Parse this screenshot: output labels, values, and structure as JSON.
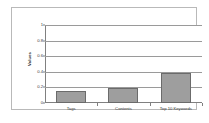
{
  "chart_data": {
    "type": "bar",
    "title": "",
    "subtitle": "",
    "xlabel": "",
    "ylabel": "Values",
    "categories": [
      "Tags",
      "Contents",
      "Top 10 Keywords"
    ],
    "values": [
      0.15,
      0.19,
      0.38
    ],
    "series": [
      {
        "name": "Series 1",
        "values": [
          0.15,
          0.19,
          0.38
        ]
      }
    ],
    "ylim": [
      0,
      1
    ],
    "ytick_labels": [
      "0",
      "0.2",
      "0.4",
      "0.6",
      "0.8",
      "1"
    ],
    "ytick_values": [
      0,
      0.2,
      0.4,
      0.6,
      0.8,
      1
    ],
    "grid": true,
    "grid_axis": "y",
    "legend": false,
    "legend_position": "none",
    "bar_fill_color": "#9e9e9e",
    "bar_border_color": "#6b6b6b",
    "gridline_color": "#9a9a9a",
    "axis_color": "#808080",
    "frame_color": "#b9b9b9",
    "background_color": "#ffffff",
    "text_color": "#3a3a3a"
  }
}
